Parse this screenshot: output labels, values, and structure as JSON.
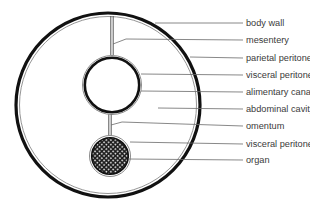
{
  "diagram": {
    "type": "anatomical cross-section",
    "colors": {
      "stroke": "#111111",
      "membrane": "#8a8a8a",
      "leader": "#6a6a6a",
      "label": "#3a3a3a",
      "background": "#ffffff"
    },
    "labels": [
      {
        "id": "body-wall",
        "text": "body wall",
        "y": 23
      },
      {
        "id": "mesentery",
        "text": "mesentery",
        "y": 40
      },
      {
        "id": "parietal-peritoneum",
        "text": "parietal peritoneum",
        "y": 58
      },
      {
        "id": "visceral-peritoneum-1",
        "text": "visceral peritoneum",
        "y": 75
      },
      {
        "id": "alimentary-canal",
        "text": "alimentary canal",
        "y": 92
      },
      {
        "id": "abdominal-cavity",
        "text": "abdominal cavity",
        "y": 109
      },
      {
        "id": "omentum",
        "text": "omentum",
        "y": 126
      },
      {
        "id": "visceral-peritoneum-2",
        "text": "visceral peritoneum",
        "y": 144
      },
      {
        "id": "organ",
        "text": "organ",
        "y": 160
      }
    ]
  }
}
